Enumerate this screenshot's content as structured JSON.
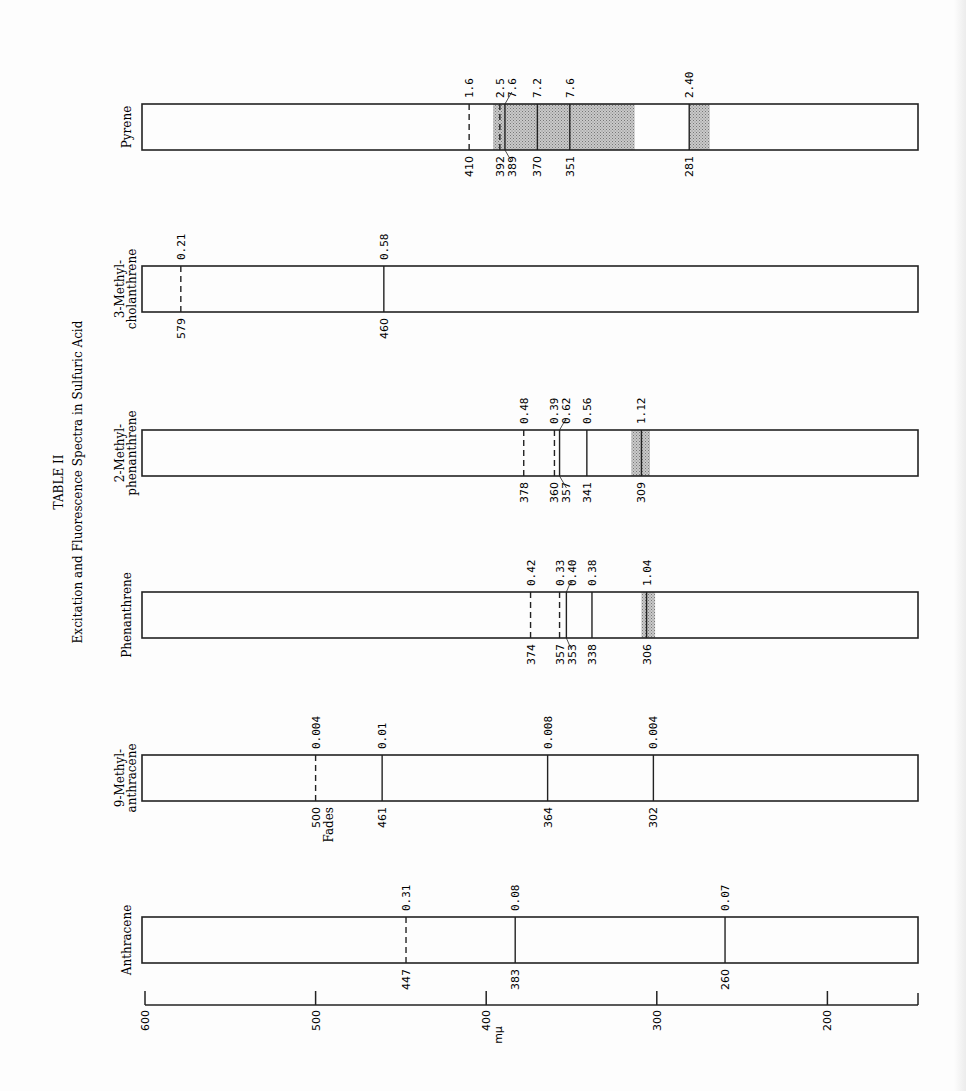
{
  "title": {
    "table_number": "TABLE II",
    "caption": "Excitation and Fluorescence Spectra in Sulfuric Acid"
  },
  "axis": {
    "unit_label": "mμ",
    "ticks": [
      "600",
      "500",
      "400",
      "300",
      "200"
    ]
  },
  "compounds": [
    {
      "name_line1": "Pyrene",
      "name_line2": ""
    },
    {
      "name_line1": "3-Methyl-",
      "name_line2": "cholanthrene"
    },
    {
      "name_line1": "2-Methyl-",
      "name_line2": "phenanthrene"
    },
    {
      "name_line1": "Phenanthrene",
      "name_line2": ""
    },
    {
      "name_line1": "9-Methyl-",
      "name_line2": "anthracene"
    },
    {
      "name_line1": "Anthracene",
      "name_line2": ""
    }
  ],
  "chart_data": {
    "type": "table",
    "xlabel": "mμ",
    "xlim": [
      600,
      147
    ],
    "x_ticks": [
      600,
      500,
      400,
      300,
      200
    ],
    "legend": {
      "dashed_line": "fluorescence band",
      "solid_line": "excitation band",
      "shaded_region": "broad excitation region"
    },
    "series": [
      {
        "name": "Pyrene",
        "lines": [
          {
            "wavelength": 410,
            "intensity": "1.6",
            "style": "dashed"
          },
          {
            "wavelength": 392,
            "intensity": "2.5",
            "style": "dashed"
          },
          {
            "wavelength": 389,
            "intensity": "7.6",
            "style": "solid"
          },
          {
            "wavelength": 370,
            "intensity": "7.2",
            "style": "solid"
          },
          {
            "wavelength": 351,
            "intensity": "7.6",
            "style": "solid"
          },
          {
            "wavelength": 281,
            "intensity": "2.40",
            "style": "solid"
          }
        ],
        "shaded": [
          [
            396,
            313
          ],
          [
            281,
            269
          ]
        ]
      },
      {
        "name": "3-Methylcholanthrene",
        "lines": [
          {
            "wavelength": 579,
            "intensity": "0.21",
            "style": "dashed"
          },
          {
            "wavelength": 460,
            "intensity": "0.58",
            "style": "solid"
          }
        ],
        "shaded": []
      },
      {
        "name": "2-Methylphenanthrene",
        "lines": [
          {
            "wavelength": 378,
            "intensity": "0.48",
            "style": "dashed"
          },
          {
            "wavelength": 360,
            "intensity": "0.39",
            "style": "dashed"
          },
          {
            "wavelength": 357,
            "intensity": "0.62",
            "style": "solid"
          },
          {
            "wavelength": 341,
            "intensity": "0.56",
            "style": "solid"
          },
          {
            "wavelength": 309,
            "intensity": "1.12",
            "style": "solid"
          }
        ],
        "shaded": [
          [
            315,
            304
          ]
        ]
      },
      {
        "name": "Phenanthrene",
        "lines": [
          {
            "wavelength": 374,
            "intensity": "0.42",
            "style": "dashed"
          },
          {
            "wavelength": 357,
            "intensity": "0.33",
            "style": "dashed"
          },
          {
            "wavelength": 353,
            "intensity": "0.40",
            "style": "solid"
          },
          {
            "wavelength": 338,
            "intensity": "0.38",
            "style": "solid"
          },
          {
            "wavelength": 306,
            "intensity": "1.04",
            "style": "solid"
          }
        ],
        "shaded": [
          [
            309,
            301
          ]
        ]
      },
      {
        "name": "9-Methylanthracene",
        "lines": [
          {
            "wavelength": 500,
            "intensity": "0.004",
            "style": "dashed",
            "note": "Fades"
          },
          {
            "wavelength": 461,
            "intensity": "0.01",
            "style": "solid"
          },
          {
            "wavelength": 364,
            "intensity": "0.008",
            "style": "solid"
          },
          {
            "wavelength": 302,
            "intensity": "0.004",
            "style": "solid"
          }
        ],
        "shaded": []
      },
      {
        "name": "Anthracene",
        "lines": [
          {
            "wavelength": 447,
            "intensity": "0.31",
            "style": "dashed"
          },
          {
            "wavelength": 383,
            "intensity": "0.08",
            "style": "solid"
          },
          {
            "wavelength": 260,
            "intensity": "0.07",
            "style": "solid"
          }
        ],
        "shaded": []
      }
    ]
  }
}
